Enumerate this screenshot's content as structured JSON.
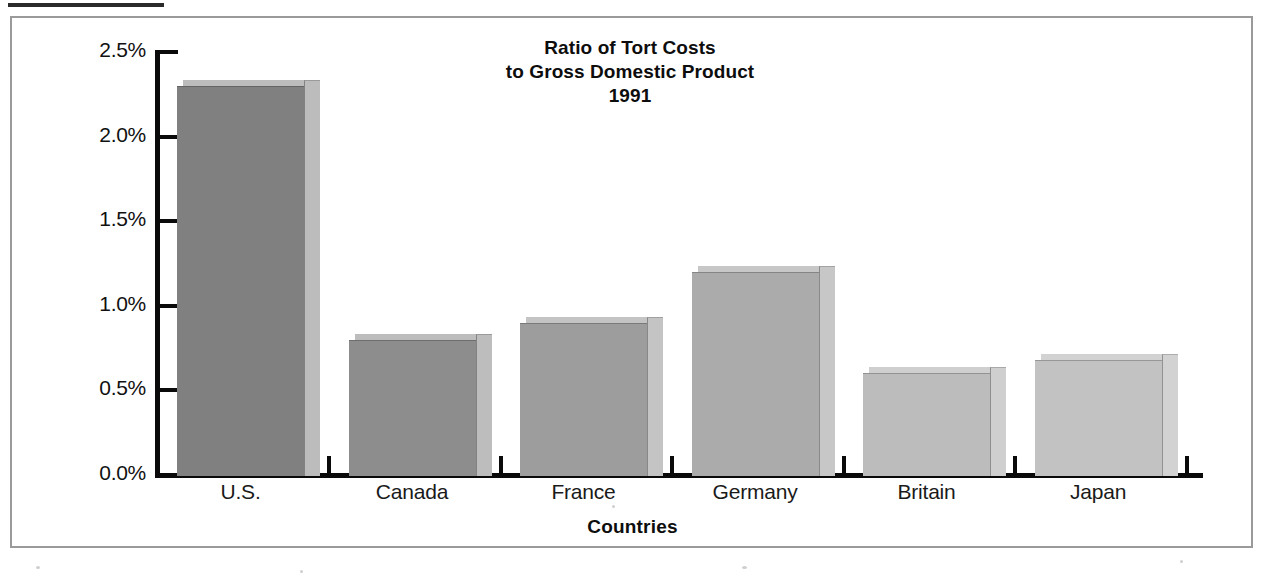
{
  "chart_data": {
    "type": "bar",
    "title": "Ratio of Tort Costs to Gross Domestic Product 1991",
    "title_lines": [
      "Ratio of Tort Costs",
      "to Gross Domestic Product",
      "1991"
    ],
    "xlabel": "Countries",
    "ylabel": "",
    "categories": [
      "U.S.",
      "Canada",
      "France",
      "Germany",
      "Britain",
      "Japan"
    ],
    "values": [
      2.3,
      0.8,
      0.9,
      1.2,
      0.6,
      0.68
    ],
    "value_labels": [
      "2.3%",
      "0.8%",
      "0.9%",
      "1.2%",
      "0.6%",
      "0.68%"
    ],
    "ylim": [
      0.0,
      2.5
    ],
    "ytick_values": [
      0.0,
      0.5,
      1.0,
      1.5,
      2.0,
      2.5
    ],
    "ytick_labels": [
      "0.0%",
      "0.5%",
      "1.0%",
      "1.5%",
      "2.0%",
      "2.5%"
    ],
    "grid": false,
    "legend": null,
    "units": "percent of GDP",
    "year": "1991",
    "bar_colors": [
      "#808080",
      "#8d8d8d",
      "#9d9d9d",
      "#ababab",
      "#bcbcbc",
      "#c2c2c2"
    ],
    "bar_side_colors": [
      "#bcbcbc",
      "#bdbdbd",
      "#c4c4c4",
      "#c7c7c7",
      "#cfcfcf",
      "#d2d2d2"
    ]
  },
  "figure": {
    "border_color": "#9a9a9a",
    "background": "#ffffff",
    "axis_color": "#0a0a0a"
  }
}
